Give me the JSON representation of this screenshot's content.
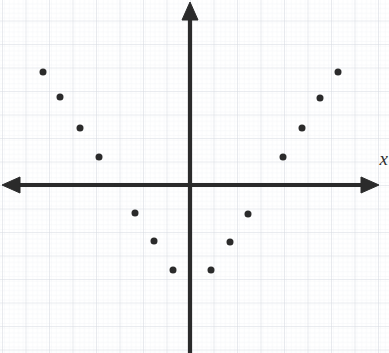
{
  "figure": {
    "title": "",
    "width": 389,
    "height": 353,
    "background_color": "#ffffff"
  },
  "axes": {
    "x_label": "x",
    "y_label": "",
    "x_label_style": "italic",
    "axis_color": "#2b2b2b",
    "axis_line_width": 4,
    "origin_px": {
      "x": 190,
      "y": 185
    },
    "pixels_per_unit": 23.5,
    "x_axis_arrow_left": true,
    "x_axis_arrow_right": true,
    "y_axis_arrow_top": true,
    "y_axis_arrow_bottom": false
  },
  "grid": {
    "visible": true,
    "major_color": "#d8dce2",
    "minor_color": "#eef0f3",
    "major_spacing_px": 23.5,
    "minor_spacing_px": 4.7,
    "tick_labels_visible": false
  },
  "points": {
    "marker_color": "#2b2b2b",
    "marker_size_px": 7,
    "on_axis_marker_size_px": 4,
    "count": 17
  },
  "chart_data": {
    "type": "scatter",
    "title": "",
    "xlabel": "x",
    "ylabel": "",
    "grid": true,
    "legend": "none",
    "xlim": [
      -8.1,
      8.5
    ],
    "ylim": [
      -7.2,
      7.9
    ],
    "x_tick_labels": [],
    "y_tick_labels": [],
    "x": [
      -6.25,
      -5.5,
      -4.75,
      -4,
      -3.15,
      -2.35,
      -1.55,
      -0.7,
      0,
      0.9,
      1.7,
      2.5,
      3.15,
      3.95,
      4.75,
      5.55,
      6.3
    ],
    "y": [
      4.8,
      3.75,
      2.4,
      1.2,
      0,
      -1.2,
      -2.4,
      -3.6,
      -4.7,
      -3.6,
      -2.4,
      -1.2,
      0,
      1.2,
      2.4,
      3.75,
      4.8
    ],
    "points_px": [
      {
        "x": 43,
        "y": 72,
        "on_axis": false
      },
      {
        "x": 60,
        "y": 97,
        "on_axis": false
      },
      {
        "x": 80,
        "y": 128,
        "on_axis": false
      },
      {
        "x": 99,
        "y": 157,
        "on_axis": false
      },
      {
        "x": 116,
        "y": 185,
        "on_axis": true
      },
      {
        "x": 135,
        "y": 213,
        "on_axis": false
      },
      {
        "x": 154,
        "y": 241,
        "on_axis": false
      },
      {
        "x": 173,
        "y": 270,
        "on_axis": false
      },
      {
        "x": 190,
        "y": 300,
        "on_axis": true
      },
      {
        "x": 211,
        "y": 270,
        "on_axis": false
      },
      {
        "x": 230,
        "y": 242,
        "on_axis": false
      },
      {
        "x": 248,
        "y": 214,
        "on_axis": false
      },
      {
        "x": 264,
        "y": 185,
        "on_axis": true
      },
      {
        "x": 283,
        "y": 157,
        "on_axis": false
      },
      {
        "x": 302,
        "y": 128,
        "on_axis": false
      },
      {
        "x": 320,
        "y": 98,
        "on_axis": false
      },
      {
        "x": 338,
        "y": 72,
        "on_axis": false
      }
    ]
  }
}
